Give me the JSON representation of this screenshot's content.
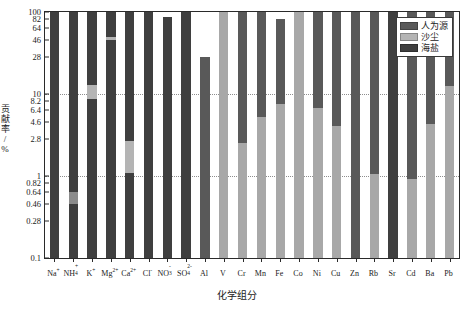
{
  "chart_data": {
    "type": "bar",
    "title": "",
    "xlabel": "化学组分",
    "ylabel": "贡献率/%",
    "ylabel_chars": [
      "贡",
      "献",
      "率",
      "/",
      "%"
    ],
    "scale": "log",
    "ylim": [
      0.1,
      100
    ],
    "grid": true,
    "gridlines": [
      10,
      1
    ],
    "ytick_labels": [
      "100",
      "82",
      "64",
      "46",
      "28",
      "10",
      "8.2",
      "6.4",
      "4.6",
      "2.8",
      "1",
      "0.82",
      "0.64",
      "0.46",
      "0.28",
      "0.1"
    ],
    "ytick_values": [
      100,
      82,
      64,
      46,
      28,
      10,
      8.2,
      6.4,
      4.6,
      2.8,
      1,
      0.82,
      0.64,
      0.46,
      0.28,
      0.1
    ],
    "legend_position": "top-right",
    "legend": [
      {
        "name": "人为源",
        "color": "#595959"
      },
      {
        "name": "沙尘",
        "color": "#b4b4b4"
      },
      {
        "name": "海盐",
        "color": "#3f3f3f"
      }
    ],
    "categories": [
      {
        "base": "Na",
        "sup": "+",
        "sub": ""
      },
      {
        "base": "NH",
        "sup": "+",
        "sub": "4"
      },
      {
        "base": "K",
        "sup": "+",
        "sub": ""
      },
      {
        "base": "Mg",
        "sup": "2+",
        "sub": ""
      },
      {
        "base": "Ca",
        "sup": "2+",
        "sub": ""
      },
      {
        "base": "Cl",
        "sup": "-",
        "sub": ""
      },
      {
        "base": "NO",
        "sup": "-",
        "sub": "3"
      },
      {
        "base": "SO",
        "sup": "2-",
        "sub": "4"
      },
      {
        "base": "Al",
        "sup": "",
        "sub": ""
      },
      {
        "base": "V",
        "sup": "",
        "sub": ""
      },
      {
        "base": "Cr",
        "sup": "",
        "sub": ""
      },
      {
        "base": "Mn",
        "sup": "",
        "sub": ""
      },
      {
        "base": "Fe",
        "sup": "",
        "sub": ""
      },
      {
        "base": "Co",
        "sup": "",
        "sub": ""
      },
      {
        "base": "Ni",
        "sup": "",
        "sub": ""
      },
      {
        "base": "Cu",
        "sup": "",
        "sub": ""
      },
      {
        "base": "Zn",
        "sup": "",
        "sub": ""
      },
      {
        "base": "Rb",
        "sup": "",
        "sub": ""
      },
      {
        "base": "Sr",
        "sup": "",
        "sub": ""
      },
      {
        "base": "Cd",
        "sup": "",
        "sub": ""
      },
      {
        "base": "Ba",
        "sup": "",
        "sub": ""
      },
      {
        "base": "Pb",
        "sup": "",
        "sub": ""
      }
    ],
    "series": [
      {
        "name": "人为源",
        "color": "#595959",
        "values": [
          0,
          0,
          0,
          0,
          0,
          0,
          0,
          0,
          100,
          100,
          100,
          100,
          100,
          100,
          100,
          100,
          100,
          100,
          100,
          100,
          100,
          100
        ]
      },
      {
        "name": "沙尘",
        "color": "#b4b4b4",
        "values": [
          0,
          0.56,
          11.5,
          100,
          2.6,
          0,
          0,
          0,
          4.2,
          100,
          8.0,
          100,
          2.8,
          38,
          100,
          4.4,
          100,
          8.0,
          100,
          1.2,
          100,
          100
        ]
      },
      {
        "name": "海盐",
        "color": "#3f3f3f",
        "values": [
          100,
          100,
          100,
          46,
          100,
          100,
          88,
          100,
          0,
          0,
          0,
          0,
          0,
          0,
          0,
          0,
          0,
          0,
          0,
          0,
          0,
          0
        ]
      }
    ],
    "bars": [
      {
        "category": "Na+",
        "top": 100,
        "split": [
          {
            "color": "#3f3f3f",
            "from": 0.1,
            "to": 100
          }
        ]
      },
      {
        "category": "NH4+",
        "top": 100,
        "split": [
          {
            "color": "#3f3f3f",
            "from": 0.1,
            "to": 0.46
          },
          {
            "color": "#8c8c8c",
            "from": 0.46,
            "to": 0.64
          },
          {
            "color": "#3f3f3f",
            "from": 0.64,
            "to": 100
          }
        ]
      },
      {
        "category": "K+",
        "top": 100,
        "split": [
          {
            "color": "#3f3f3f",
            "from": 0.1,
            "to": 8.6
          },
          {
            "color": "#b4b4b4",
            "from": 8.6,
            "to": 13
          },
          {
            "color": "#3f3f3f",
            "from": 13,
            "to": 100
          }
        ]
      },
      {
        "category": "Mg2+",
        "top": 100,
        "split": [
          {
            "color": "#3f3f3f",
            "from": 0.1,
            "to": 46
          },
          {
            "color": "#b4b4b4",
            "from": 46,
            "to": 50
          },
          {
            "color": "#3f3f3f",
            "from": 50,
            "to": 100
          }
        ]
      },
      {
        "category": "Ca2+",
        "top": 100,
        "split": [
          {
            "color": "#3f3f3f",
            "from": 0.1,
            "to": 1.1
          },
          {
            "color": "#b4b4b4",
            "from": 1.1,
            "to": 2.7
          },
          {
            "color": "#3f3f3f",
            "from": 2.7,
            "to": 100
          }
        ]
      },
      {
        "category": "Cl-",
        "top": 100,
        "split": [
          {
            "color": "#3f3f3f",
            "from": 0.1,
            "to": 100
          }
        ]
      },
      {
        "category": "NO3-",
        "top": 88,
        "split": [
          {
            "color": "#3f3f3f",
            "from": 0.1,
            "to": 88
          }
        ]
      },
      {
        "category": "SO42-",
        "top": 100,
        "split": [
          {
            "color": "#3f3f3f",
            "from": 0.1,
            "to": 100
          }
        ]
      },
      {
        "category": "Al",
        "top": 28,
        "split": [
          {
            "color": "#595959",
            "from": 0.1,
            "to": 28
          }
        ]
      },
      {
        "category": "V",
        "top": 100,
        "split": [
          {
            "color": "#a8a8a8",
            "from": 0.1,
            "to": 100
          }
        ]
      },
      {
        "category": "Cr",
        "top": 100,
        "split": [
          {
            "color": "#595959",
            "from": 2.5,
            "to": 100
          },
          {
            "color": "#a8a8a8",
            "from": 0.1,
            "to": 2.5
          }
        ]
      },
      {
        "category": "Mn",
        "top": 100,
        "split": [
          {
            "color": "#595959",
            "from": 5.2,
            "to": 100
          },
          {
            "color": "#a8a8a8",
            "from": 0.1,
            "to": 5.2
          }
        ]
      },
      {
        "category": "Fe",
        "top": 82,
        "split": [
          {
            "color": "#595959",
            "from": 7.6,
            "to": 82
          },
          {
            "color": "#a8a8a8",
            "from": 0.1,
            "to": 7.6
          }
        ]
      },
      {
        "category": "Co",
        "top": 100,
        "split": [
          {
            "color": "#a8a8a8",
            "from": 0.1,
            "to": 100
          }
        ]
      },
      {
        "category": "Ni",
        "top": 100,
        "split": [
          {
            "color": "#595959",
            "from": 6.8,
            "to": 100
          },
          {
            "color": "#a8a8a8",
            "from": 0.1,
            "to": 6.8
          }
        ]
      },
      {
        "category": "Cu",
        "top": 100,
        "split": [
          {
            "color": "#595959",
            "from": 4.1,
            "to": 100
          },
          {
            "color": "#a8a8a8",
            "from": 0.1,
            "to": 4.1
          }
        ]
      },
      {
        "category": "Zn",
        "top": 100,
        "split": [
          {
            "color": "#595959",
            "from": 0.1,
            "to": 100
          }
        ]
      },
      {
        "category": "Rb",
        "top": 100,
        "split": [
          {
            "color": "#595959",
            "from": 1.05,
            "to": 100
          },
          {
            "color": "#a8a8a8",
            "from": 0.1,
            "to": 1.05
          }
        ]
      },
      {
        "category": "Sr",
        "top": 100,
        "split": [
          {
            "color": "#3f3f3f",
            "from": 0.1,
            "to": 100
          }
        ]
      },
      {
        "category": "Cd",
        "top": 100,
        "split": [
          {
            "color": "#595959",
            "from": 0.92,
            "to": 100
          },
          {
            "color": "#a8a8a8",
            "from": 0.1,
            "to": 0.92
          }
        ]
      },
      {
        "category": "Ba",
        "top": 100,
        "split": [
          {
            "color": "#595959",
            "from": 4.3,
            "to": 100
          },
          {
            "color": "#a8a8a8",
            "from": 0.1,
            "to": 4.3
          }
        ]
      },
      {
        "category": "Pb",
        "top": 100,
        "split": [
          {
            "color": "#595959",
            "from": 12.5,
            "to": 100
          },
          {
            "color": "#a8a8a8",
            "from": 0.1,
            "to": 12.5
          }
        ]
      }
    ]
  }
}
